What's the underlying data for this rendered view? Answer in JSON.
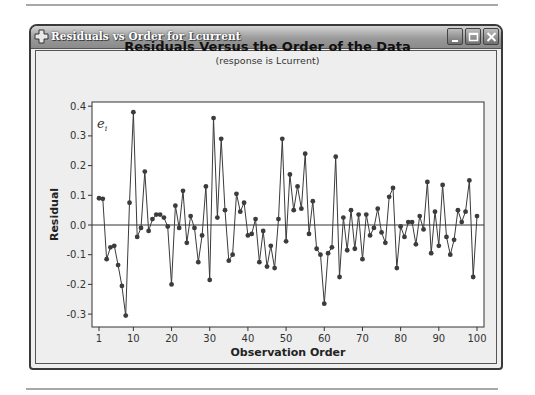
{
  "window": {
    "title": "Residuals vs Order for Lcurrent",
    "icon": "minitab-cross-icon",
    "controls": [
      "minimize",
      "maximize",
      "close"
    ]
  },
  "chart": {
    "title": "Residuals Versus the Order of the Data",
    "subtitle": "(response is Lcurrent)",
    "corner_label": "e_i"
  },
  "chart_data": {
    "type": "line",
    "title": "Residuals Versus the Order of the Data",
    "subtitle": "(response is Lcurrent)",
    "xlabel": "Observation Order",
    "ylabel": "Residual",
    "x_ticks": [
      1,
      10,
      20,
      30,
      40,
      50,
      60,
      70,
      80,
      90,
      100
    ],
    "y_ticks": [
      0.4,
      0.3,
      0.2,
      0.1,
      0.0,
      -0.1,
      -0.2,
      -0.3
    ],
    "y_tick_labels": [
      "0.4",
      "0.3",
      "0.2",
      "0.1",
      "0.0",
      "-0.1",
      "-0.2",
      "-0.3"
    ],
    "xlim": [
      1,
      101
    ],
    "ylim": [
      -0.34,
      0.41
    ],
    "reference_line": 0.0,
    "markers": true,
    "grid": false,
    "legend": null,
    "series": [
      {
        "name": "Residual",
        "x": [
          1,
          2,
          3,
          4,
          5,
          6,
          7,
          8,
          9,
          10,
          11,
          12,
          13,
          14,
          15,
          16,
          17,
          18,
          19,
          20,
          21,
          22,
          23,
          24,
          25,
          26,
          27,
          28,
          29,
          30,
          31,
          32,
          33,
          34,
          35,
          36,
          37,
          38,
          39,
          40,
          41,
          42,
          43,
          44,
          45,
          46,
          47,
          48,
          49,
          50,
          51,
          52,
          53,
          54,
          55,
          56,
          57,
          58,
          59,
          60,
          61,
          62,
          63,
          64,
          65,
          66,
          67,
          68,
          69,
          70,
          71,
          72,
          73,
          74,
          75,
          76,
          77,
          78,
          79,
          80,
          81,
          82,
          83,
          84,
          85,
          86,
          87,
          88,
          89,
          90,
          91,
          92,
          93,
          94,
          95,
          96,
          97,
          98,
          99,
          100
        ],
        "values": [
          0.09,
          0.088,
          -0.115,
          -0.075,
          -0.07,
          -0.135,
          -0.205,
          -0.305,
          0.075,
          0.38,
          -0.04,
          -0.01,
          0.18,
          -0.02,
          0.02,
          0.035,
          0.035,
          0.025,
          -0.005,
          -0.2,
          0.065,
          -0.01,
          0.115,
          -0.06,
          0.03,
          -0.01,
          -0.125,
          -0.035,
          0.13,
          -0.185,
          0.36,
          0.025,
          0.29,
          0.05,
          -0.12,
          -0.1,
          0.105,
          0.045,
          0.075,
          -0.035,
          -0.03,
          0.02,
          -0.125,
          -0.02,
          -0.14,
          -0.07,
          -0.145,
          0.02,
          0.29,
          -0.055,
          0.17,
          0.05,
          0.13,
          0.055,
          0.24,
          -0.03,
          0.08,
          -0.08,
          -0.1,
          -0.265,
          -0.095,
          -0.075,
          0.23,
          -0.175,
          0.025,
          -0.085,
          0.05,
          -0.08,
          0.035,
          -0.115,
          0.035,
          -0.035,
          -0.01,
          0.055,
          -0.025,
          -0.06,
          0.095,
          0.125,
          -0.145,
          -0.005,
          -0.04,
          0.01,
          0.01,
          -0.065,
          0.03,
          -0.015,
          0.145,
          -0.095,
          0.045,
          -0.07,
          0.135,
          -0.04,
          -0.1,
          -0.05,
          0.05,
          0.01,
          0.045,
          0.15,
          -0.175,
          0.03
        ]
      }
    ]
  }
}
